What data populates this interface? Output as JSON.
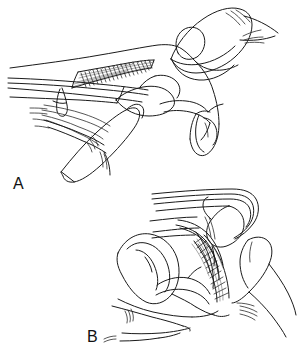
{
  "figure": {
    "kind": "anatomical-line-drawing",
    "background_color": "#ffffff",
    "ink_color": "#1a1a1a",
    "width": 303,
    "height": 348,
    "panels": [
      {
        "id": "A",
        "label": "A",
        "label_x": 13,
        "label_y": 176,
        "caption": "",
        "subject": "lateral view of finger in extension with examiner's fingers palpating the flexor tendon sheath",
        "shading": {
          "name": "tendon-hatching",
          "description": "dense cross-hatched tendon/sheath region along the volar aspect of the proximal phalanx",
          "color": "#141414"
        }
      },
      {
        "id": "B",
        "label": "B",
        "label_x": 87,
        "label_y": 329,
        "caption": "",
        "subject": "lateral view of finger in flexion with examiner's fingers palpating the flexor tendon sheath",
        "shading": {
          "name": "tendon-hatching",
          "description": "dense cross-hatched tendon/sheath region along the flexed volar aspect",
          "color": "#141414"
        }
      }
    ]
  }
}
